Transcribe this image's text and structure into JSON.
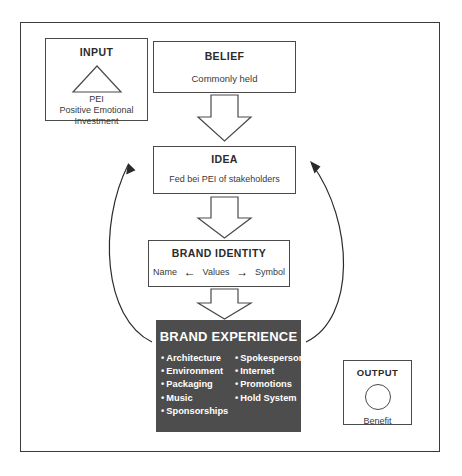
{
  "diagram": {
    "title_visible": false,
    "frame": {
      "name": "outer-frame"
    },
    "input": {
      "title": "INPUT",
      "shape": "triangle",
      "abbrev": "PEI",
      "line1": "Positive Emotional",
      "line2": "Investment"
    },
    "belief": {
      "title": "BELIEF",
      "subtitle": "Commonly held"
    },
    "idea": {
      "title": "IDEA",
      "subtitle": "Fed bei PEI  of stakeholders"
    },
    "brand_identity": {
      "title": "BRAND IDENTITY",
      "left": "Name",
      "left_arrow": "←",
      "center": "Values",
      "right_arrow": "→",
      "right": "Symbol"
    },
    "brand_experience": {
      "title": "BRAND EXPERIENCE",
      "column_left": [
        "Architecture",
        "Environment",
        "Packaging",
        "Music",
        "Sponsorships"
      ],
      "column_right": [
        "Spokesperson",
        "Internet",
        "Promotions",
        "Hold System"
      ]
    },
    "output": {
      "title": "OUTPUT",
      "shape": "circle",
      "label": "Benefit"
    },
    "connectors": {
      "belief_to_idea": "block-arrow-down",
      "idea_to_identity": "block-arrow-down",
      "identity_to_experience": "block-arrow-down",
      "feedback_left": "curved-arrow-up",
      "feedback_right": "curved-arrow-up"
    },
    "colors": {
      "experience_fill": "#4d4d4d",
      "experience_text": "#ffffff",
      "stroke": "#4a4a4a",
      "background": "#ffffff"
    }
  }
}
